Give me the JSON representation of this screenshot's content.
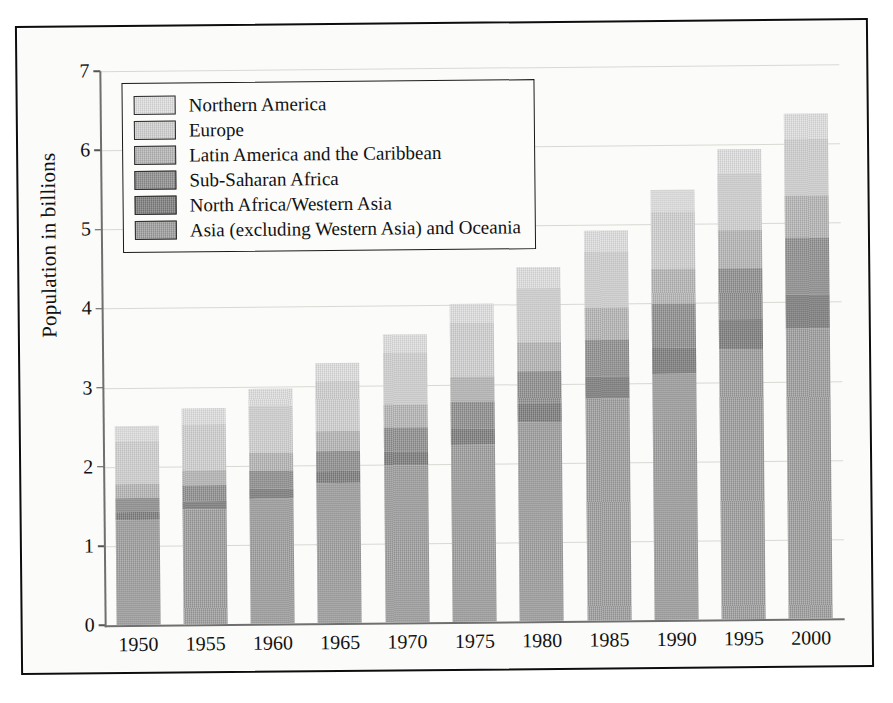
{
  "chart_data": {
    "type": "bar",
    "subtype": "stacked-bar",
    "title": "",
    "xlabel": "",
    "ylabel": "Population in billions",
    "ylim": [
      0,
      7
    ],
    "ytick_values": [
      0,
      1,
      2,
      3,
      4,
      5,
      6,
      7
    ],
    "ytick_labels": [
      "0",
      "1",
      "2",
      "3",
      "4",
      "5",
      "6",
      "7"
    ],
    "grid": true,
    "legend_position": "upper-left-inside",
    "categories": [
      "1950",
      "1955",
      "1960",
      "1965",
      "1970",
      "1975",
      "1980",
      "1985",
      "1990",
      "1995",
      "2000"
    ],
    "stack_order_bottom_to_top": [
      "Asia (excluding Western Asia) and Oceania",
      "North Africa/Western Asia",
      "Sub-Saharan Africa",
      "Latin America and the Caribbean",
      "Europe",
      "Northern America"
    ],
    "series": [
      {
        "name": "Asia (excluding Western Asia) and Oceania",
        "color": "#9c9c9c",
        "values": [
          1.33,
          1.45,
          1.58,
          1.77,
          1.99,
          2.24,
          2.52,
          2.8,
          3.11,
          3.41,
          3.66
        ]
      },
      {
        "name": "North Africa/Western Asia",
        "color": "#7c7c7c",
        "values": [
          0.1,
          0.11,
          0.13,
          0.15,
          0.17,
          0.2,
          0.24,
          0.28,
          0.33,
          0.38,
          0.43
        ]
      },
      {
        "name": "Sub-Saharan Africa",
        "color": "#8e8e8e",
        "values": [
          0.18,
          0.2,
          0.23,
          0.26,
          0.3,
          0.34,
          0.4,
          0.47,
          0.55,
          0.64,
          0.73
        ]
      },
      {
        "name": "Latin America and the Caribbean",
        "color": "#b4b4b4",
        "values": [
          0.17,
          0.19,
          0.22,
          0.25,
          0.29,
          0.32,
          0.36,
          0.4,
          0.44,
          0.48,
          0.52
        ]
      },
      {
        "name": "Europe",
        "color": "#cfcfcf",
        "values": [
          0.55,
          0.58,
          0.6,
          0.63,
          0.66,
          0.68,
          0.69,
          0.71,
          0.72,
          0.73,
          0.73
        ]
      },
      {
        "name": "Northern America",
        "color": "#dedede",
        "values": [
          0.19,
          0.2,
          0.21,
          0.22,
          0.23,
          0.24,
          0.26,
          0.27,
          0.28,
          0.3,
          0.31
        ]
      }
    ],
    "totals": [
      2.52,
      2.73,
      2.97,
      3.28,
      3.64,
      4.02,
      4.47,
      4.93,
      5.43,
      5.94,
      6.38
    ]
  },
  "legend": {
    "items": [
      {
        "label": "Northern America",
        "color": "#dedede"
      },
      {
        "label": "Europe",
        "color": "#cfcfcf"
      },
      {
        "label": "Latin America and the Caribbean",
        "color": "#b4b4b4"
      },
      {
        "label": "Sub-Saharan Africa",
        "color": "#8e8e8e"
      },
      {
        "label": "North Africa/Western Asia",
        "color": "#7c7c7c"
      },
      {
        "label": "Asia (excluding Western Asia) and Oceania",
        "color": "#9c9c9c"
      }
    ]
  }
}
